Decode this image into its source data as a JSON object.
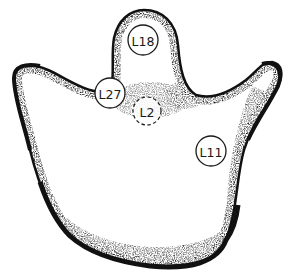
{
  "diagram": {
    "type": "anatomical-outline",
    "style": "stippled line art",
    "colors": {
      "background": "#ffffff",
      "ink": "#111111"
    },
    "markers": [
      {
        "id": "L18",
        "label": "L18",
        "cx": 143,
        "cy": 40,
        "r": 15,
        "line": "solid"
      },
      {
        "id": "L27",
        "label": "L27",
        "cx": 110,
        "cy": 93,
        "r": 15,
        "line": "solid"
      },
      {
        "id": "L2",
        "label": "L2",
        "cx": 147,
        "cy": 111,
        "r": 14,
        "line": "dashed"
      },
      {
        "id": "L11",
        "label": "L11",
        "cx": 211,
        "cy": 151,
        "r": 15,
        "line": "solid"
      }
    ]
  }
}
